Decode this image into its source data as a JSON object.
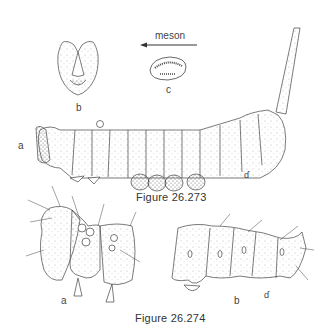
{
  "figure_273": {
    "caption": "Figure 26.273",
    "panels": {
      "a": {
        "label": "a",
        "description": "lateral view of caterpillar with anal horn"
      },
      "b": {
        "label": "b",
        "description": "head capsule, frontal view"
      },
      "c": {
        "label": "c",
        "description": "proleg crochets"
      }
    },
    "arrow_label": "meson"
  },
  "figure_274": {
    "caption": "Figure 26.274",
    "panels": {
      "a": {
        "label": "a",
        "description": "head and thoracic segments, lateral"
      },
      "b": {
        "label": "b",
        "description": "posterior abdominal segments, lateral"
      }
    }
  },
  "signature_mark": "ɗ",
  "colors": {
    "ink": "#333333",
    "background": "#ffffff"
  }
}
